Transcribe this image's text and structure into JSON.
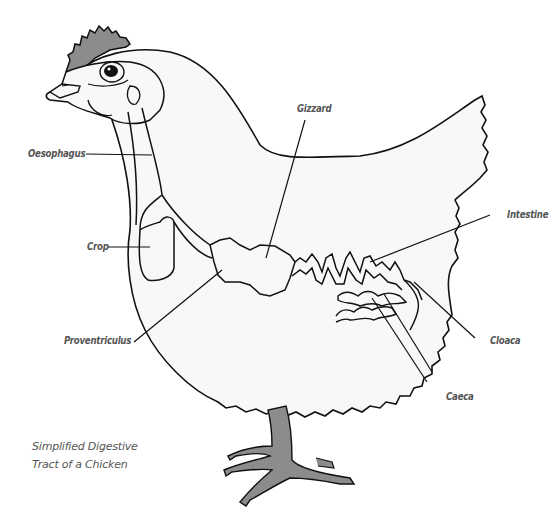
{
  "diagram": {
    "subject": "chicken",
    "caption": {
      "line1": "Simplified Digestive",
      "line2": "Tract of a Chicken"
    },
    "labels": {
      "oesophagus": "Oesophagus",
      "crop": "Crop",
      "gizzard": "Gizzard",
      "intestine": "Intestine",
      "proventriculus": "Proventriculus",
      "cloaca": "Cloaca",
      "caeca": "Caeca"
    },
    "colors": {
      "outline": "#111111",
      "body_fill": "#f8f8f8",
      "comb_and_legs": "#8c8c8c",
      "label_text": "#555555"
    }
  }
}
